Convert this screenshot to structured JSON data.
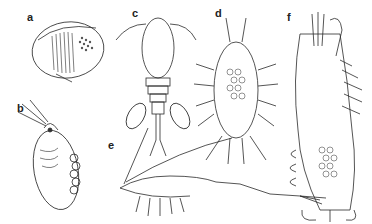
{
  "figure": {
    "panels": [
      {
        "id": "a",
        "label": "a",
        "subject": "bivalved crustacean (clam shrimp / conchostracan)"
      },
      {
        "id": "b",
        "label": "b",
        "subject": "water flea (cladoceran) with eggs"
      },
      {
        "id": "c",
        "label": "c",
        "subject": "copepod with egg sacs"
      },
      {
        "id": "d",
        "label": "d",
        "subject": "isopod with brood"
      },
      {
        "id": "e",
        "label": "e",
        "subject": "mysid / shrimp-like crustacean with long antennae"
      },
      {
        "id": "f",
        "label": "f",
        "subject": "crayfish underside with eggs"
      }
    ],
    "colors": {
      "ink": "#222222",
      "background": "#ffffff"
    }
  }
}
